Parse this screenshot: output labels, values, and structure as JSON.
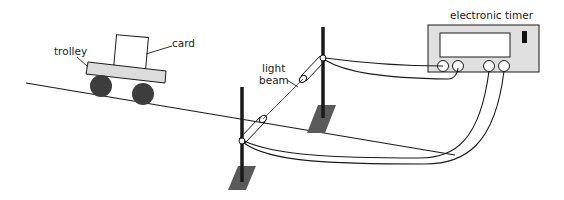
{
  "diagram": {
    "type": "physics-apparatus",
    "labels": {
      "trolley": "trolley",
      "card": "card",
      "light_beam_line1": "light",
      "light_beam_line2": "beam",
      "timer": "electronic timer"
    },
    "components": [
      {
        "id": "ramp",
        "kind": "inclined-plane"
      },
      {
        "id": "trolley",
        "kind": "trolley",
        "wheels": 2
      },
      {
        "id": "card",
        "kind": "card",
        "mounted_on": "trolley"
      },
      {
        "id": "light-gate-1",
        "kind": "light-gate",
        "position": "upper"
      },
      {
        "id": "light-gate-2",
        "kind": "light-gate",
        "position": "lower"
      },
      {
        "id": "timer",
        "kind": "electronic-timer",
        "sockets": 4
      }
    ],
    "connections": [
      {
        "from": "light-gate-1",
        "to": "timer.socket-1"
      },
      {
        "from": "light-gate-1",
        "to": "timer.socket-2"
      },
      {
        "from": "light-gate-2",
        "to": "timer.socket-3"
      },
      {
        "from": "light-gate-2",
        "to": "timer.socket-4"
      }
    ],
    "colors": {
      "line": "#1a1a1a",
      "trolley_body": "#dcdcdc",
      "wheel": "#3d3d3d",
      "base_plate": "#5a5a5a",
      "timer_body": "#e0e0e0",
      "screen": "#ffffff"
    }
  }
}
